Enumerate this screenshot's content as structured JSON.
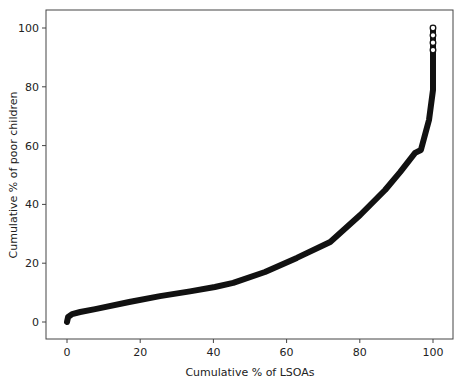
{
  "chart_data": {
    "type": "scatter",
    "title": "",
    "xlabel": "Cumulative % of LSOAs",
    "ylabel": "Cumulative % of poor children",
    "xlim": [
      0,
      100
    ],
    "ylim": [
      0,
      100
    ],
    "xticks": [
      0,
      20,
      40,
      60,
      80,
      100
    ],
    "yticks": [
      0,
      20,
      40,
      60,
      80,
      100
    ],
    "grid": false,
    "legend": null,
    "series": [
      {
        "name": "Concentration curve",
        "marker": "open-circle",
        "color": "#111111",
        "points": [
          [
            0,
            0
          ],
          [
            0.3,
            1.7
          ],
          [
            1.4,
            2.7
          ],
          [
            3.6,
            3.4
          ],
          [
            7.7,
            4.4
          ],
          [
            17,
            6.8
          ],
          [
            25.4,
            8.8
          ],
          [
            33.6,
            10.4
          ],
          [
            40.4,
            11.9
          ],
          [
            45.4,
            13.3
          ],
          [
            54.1,
            17.0
          ],
          [
            62.8,
            21.8
          ],
          [
            71.9,
            27.2
          ],
          [
            80.1,
            36.4
          ],
          [
            86.9,
            44.9
          ],
          [
            91.0,
            51.0
          ],
          [
            95.1,
            57.5
          ],
          [
            96.7,
            58.5
          ],
          [
            98.9,
            68.7
          ],
          [
            100,
            78.9
          ],
          [
            100,
            90
          ],
          [
            100,
            100
          ]
        ]
      }
    ]
  },
  "plot": {
    "frame": {
      "left": 46,
      "top": 10,
      "right": 453,
      "bottom": 339
    },
    "x_map": {
      "px0": 67,
      "px100": 433
    },
    "y_map": {
      "py0": 322,
      "py100": 28
    },
    "line_color": "#111111",
    "frame_color": "#444444"
  }
}
